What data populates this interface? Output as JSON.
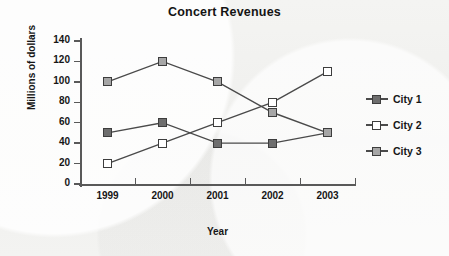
{
  "chart_data": {
    "type": "line",
    "title": "Concert Revenues",
    "xlabel": "Year",
    "ylabel": "Millions of dollars",
    "categories": [
      "1999",
      "2000",
      "2001",
      "2002",
      "2003"
    ],
    "ylim": [
      0,
      140
    ],
    "yticks": [
      "0",
      "20",
      "40",
      "60",
      "80",
      "100",
      "120",
      "140"
    ],
    "grid": false,
    "legend_position": "right",
    "series": [
      {
        "name": "City 1",
        "values": [
          50,
          60,
          40,
          40,
          50
        ],
        "marker": "filled-square",
        "color": "#6e6e6e"
      },
      {
        "name": "City 2",
        "values": [
          20,
          40,
          60,
          80,
          110
        ],
        "marker": "open-square",
        "color": "#ffffff"
      },
      {
        "name": "City 3",
        "values": [
          100,
          120,
          100,
          70,
          50
        ],
        "marker": "filled-square",
        "color": "#a6a6a6"
      }
    ]
  },
  "legend": {
    "items": [
      {
        "label": "City 1"
      },
      {
        "label": "City 2"
      },
      {
        "label": "City 3"
      }
    ]
  }
}
